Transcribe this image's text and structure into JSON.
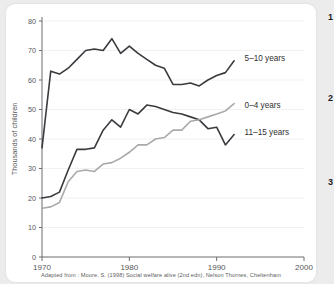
{
  "caption": "Adapted from : Moore, S. (1998) Social welfare alive (2nd edn), Nelson Thornes, Cheltenham",
  "markers": [
    {
      "label": "1"
    },
    {
      "label": "2"
    },
    {
      "label": "3"
    }
  ],
  "colors": {
    "dark_line": "#3a3b3f",
    "gray_line": "#a9aaac",
    "grid": "#f1f1f2",
    "axis": "#6b6c70",
    "text": "#55565a",
    "card_bg": "#ffffff",
    "page_bg": "#ececed"
  },
  "chart_data": {
    "type": "line",
    "title": "",
    "xlabel": "",
    "ylabel": "Thousands of children",
    "xlim": [
      1970,
      2000
    ],
    "ylim": [
      0,
      80
    ],
    "xticks": [
      1970,
      1980,
      1990,
      2000
    ],
    "xticklabels": [
      "1970",
      "1980",
      "1990",
      "2000"
    ],
    "yticks": [
      0,
      10,
      20,
      30,
      40,
      50,
      60,
      70,
      80
    ],
    "yticklabels": [
      "0",
      "10",
      "20",
      "30",
      "40",
      "50",
      "60",
      "70",
      "80"
    ],
    "grid": true,
    "legend": "inline-right-labels",
    "x": [
      1970,
      1971,
      1972,
      1973,
      1974,
      1975,
      1976,
      1977,
      1978,
      1979,
      1980,
      1981,
      1982,
      1983,
      1984,
      1985,
      1986,
      1987,
      1988,
      1989,
      1990,
      1991,
      1992
    ],
    "series": [
      {
        "name": "5-10 years",
        "label": "5–10 years",
        "color": "#3a3b3f",
        "label_x": 1993.2,
        "label_y": 67.5,
        "values": [
          37,
          63,
          62,
          64,
          67,
          70,
          70.5,
          70,
          74,
          69,
          71.5,
          69,
          67,
          65,
          64,
          58.5,
          58.5,
          59,
          58,
          60,
          61.5,
          62.5,
          66.5
        ]
      },
      {
        "name": "11-15 years",
        "label": "11–15 years",
        "color": "#3a3b3f",
        "label_x": 1993.2,
        "label_y": 42.5,
        "values": [
          20,
          20.5,
          22,
          29.5,
          36.5,
          36.5,
          37,
          43,
          46.5,
          44,
          50,
          48.5,
          51.5,
          51,
          50,
          49,
          48.5,
          47.5,
          46.5,
          43.5,
          44,
          38,
          41.5
        ]
      },
      {
        "name": "0-4 years",
        "label": "0–4 years",
        "color": "#a9aaac",
        "label_x": 1993.2,
        "label_y": 51.5,
        "values": [
          16.5,
          17,
          18.5,
          25.5,
          29,
          29.5,
          29,
          31.5,
          32,
          33.5,
          35.5,
          38,
          38,
          40,
          40.5,
          43,
          43,
          46,
          46.5,
          47.5,
          48.5,
          49.5,
          52
        ]
      }
    ]
  }
}
